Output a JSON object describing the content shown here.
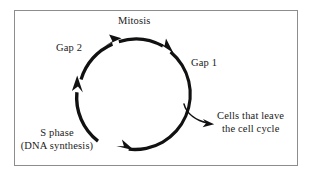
{
  "figure": {
    "kind": "cell-cycle-diagram",
    "frame_border_color": "#8d8d8d",
    "background_color": "#ffffff",
    "ink_color": "#1a1a1a",
    "cycle_direction": "clockwise",
    "labels": {
      "mitosis": "Mitosis",
      "gap2": "Gap 2",
      "gap1": "Gap 1",
      "s_phase_line1": "S phase",
      "s_phase_line2": "(DNA synthesis)",
      "exit_line1": "Cells that leave",
      "exit_line2": "the cell cycle"
    },
    "icons": {
      "cycle_arc": "cycle-arc-icon",
      "arrowhead": "arrowhead-icon",
      "exit_branch": "exit-branch-arrow-icon"
    }
  }
}
